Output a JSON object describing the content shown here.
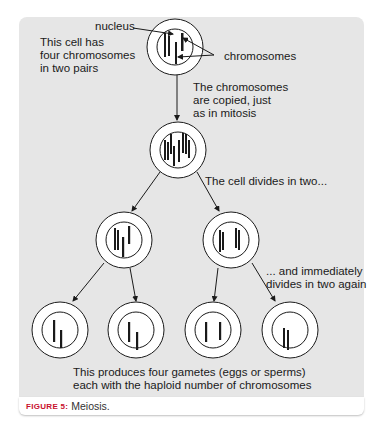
{
  "figure": {
    "caption_label": "FIGURE 5:",
    "caption_text": "Meiosis.",
    "caption_label_color": "#c8102e",
    "panel_color": "#e6e6e6"
  },
  "labels": {
    "nucleus": "nucleus",
    "cell_intro": "This cell has\nfour chromosomes\nin two pairs",
    "chromosomes": "chromosomes",
    "copied": "The chromosomes\nare copied, just\nas in mitosis",
    "divides": "The cell divides in two...",
    "divides_again": "... and immediately\ndivides in two again",
    "result": "This produces four gametes (eggs or sperms)\neach with the haploid number of chromosomes"
  },
  "diagram": {
    "stages": [
      {
        "name": "parent-cell",
        "chromosome_count": 4,
        "pairs": 2
      },
      {
        "name": "copied-cell",
        "chromosome_count": 8
      },
      {
        "name": "daughter-cells",
        "count": 2,
        "chromosomes_each": 4
      },
      {
        "name": "gametes",
        "count": 4,
        "chromosomes_each": 2
      }
    ]
  }
}
